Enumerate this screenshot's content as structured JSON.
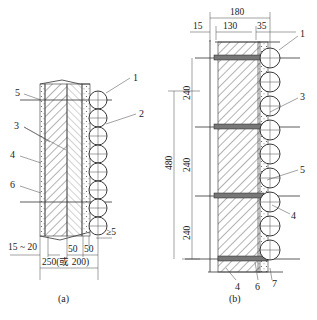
{
  "figure_a": {
    "caption": "(a)",
    "callouts": [
      "1",
      "2",
      "3",
      "4",
      "5",
      "6"
    ],
    "dims": {
      "gap": "≥5",
      "left": "15 ~ 20",
      "d1": "50",
      "d2": "50",
      "total": "250(或 200)"
    }
  },
  "figure_b": {
    "caption": "(b)",
    "callouts": [
      "1",
      "3",
      "5",
      "4",
      "4",
      "6",
      "7"
    ],
    "dims": {
      "total_width": "180",
      "w1": "15",
      "w2": "130",
      "w3": "35",
      "h1": "240",
      "h2": "240",
      "h3": "240",
      "h_total": "480"
    }
  }
}
